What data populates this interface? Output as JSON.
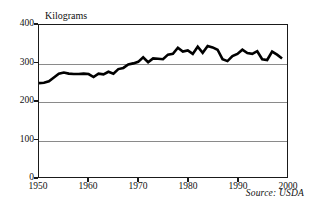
{
  "chart_data": {
    "type": "line",
    "title": "",
    "subtitle": "",
    "xlabel": "",
    "ylabel": "Kilograms",
    "unit_label": "Kilograms",
    "source_note": "Source: USDA",
    "xlim": [
      1950,
      2000
    ],
    "ylim": [
      0,
      400
    ],
    "grid": true,
    "gridlines_y": [
      100,
      200,
      300
    ],
    "legend": "none",
    "x_ticks": [
      1950,
      1960,
      1970,
      1980,
      1990,
      2000
    ],
    "y_ticks": [
      0,
      100,
      200,
      300,
      400
    ],
    "line_color": "#000000",
    "grid_color": "#8a8a8a",
    "frame_color": "#1a1a1a",
    "series": [
      {
        "name": "Kilograms",
        "x": [
          1950,
          1951,
          1952,
          1953,
          1954,
          1955,
          1956,
          1957,
          1958,
          1959,
          1960,
          1961,
          1962,
          1963,
          1964,
          1965,
          1966,
          1967,
          1968,
          1969,
          1970,
          1971,
          1972,
          1973,
          1974,
          1975,
          1976,
          1977,
          1978,
          1979,
          1980,
          1981,
          1982,
          1983,
          1984,
          1985,
          1986,
          1987,
          1988,
          1989,
          1990,
          1991,
          1992,
          1993,
          1994,
          1995,
          1996,
          1997,
          1998,
          1999
        ],
        "values": [
          247,
          248,
          252,
          262,
          272,
          275,
          272,
          271,
          271,
          272,
          271,
          263,
          272,
          270,
          277,
          272,
          284,
          287,
          296,
          299,
          303,
          315,
          302,
          312,
          311,
          310,
          322,
          324,
          340,
          330,
          333,
          324,
          343,
          327,
          345,
          341,
          335,
          310,
          305,
          318,
          324,
          335,
          326,
          324,
          331,
          310,
          308,
          330,
          322,
          312
        ]
      }
    ]
  },
  "axis": {
    "y_tick_labels": [
      "400",
      "300",
      "200",
      "100",
      "0"
    ],
    "x_tick_labels": [
      "1950",
      "1960",
      "1970",
      "1980",
      "1990",
      "2000"
    ]
  }
}
